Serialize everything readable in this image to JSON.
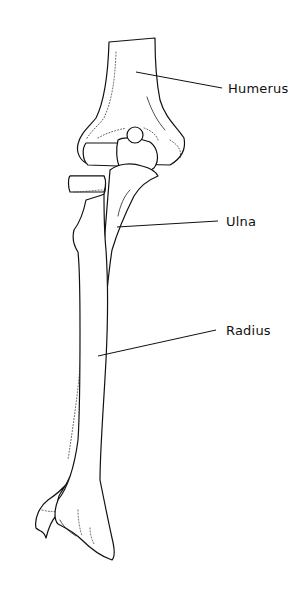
{
  "diagram": {
    "labels": [
      {
        "id": "humerus",
        "text": "Humerus"
      },
      {
        "id": "ulna",
        "text": "Ulna"
      },
      {
        "id": "radius",
        "text": "Radius"
      }
    ],
    "colors": {
      "background": "#ffffff",
      "line": "#111111"
    }
  }
}
